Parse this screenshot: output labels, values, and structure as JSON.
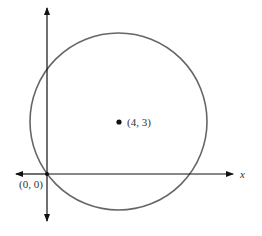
{
  "diagram": {
    "center_label": "(4, 3)",
    "origin_label": "(0, 0)",
    "x_axis_label": "x",
    "colors": {
      "axes": "#111111",
      "circle": "#666666",
      "text": "#333333",
      "background": "#ffffff"
    },
    "geometry_px": {
      "origin": [
        47,
        174
      ],
      "center": [
        118.5,
        121.5
      ],
      "radius": 88.5,
      "x_axis": {
        "from": 16,
        "to": 233
      },
      "y_axis": {
        "from": 220,
        "to": 8
      }
    }
  }
}
